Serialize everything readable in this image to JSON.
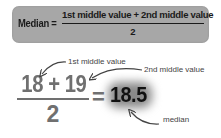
{
  "formula": {
    "label": "Median =",
    "numerator": "1st middle value + 2nd middle value",
    "denominator": "2",
    "box_color": "#a7a7a7"
  },
  "example": {
    "numerator": "18 + 19",
    "denominator": "2",
    "equals": "=",
    "result": "18.5",
    "text_color": "#707070",
    "result_color": "#111111"
  },
  "annotations": {
    "first": "1st middle value",
    "second": "2nd middle value",
    "median": "median"
  }
}
